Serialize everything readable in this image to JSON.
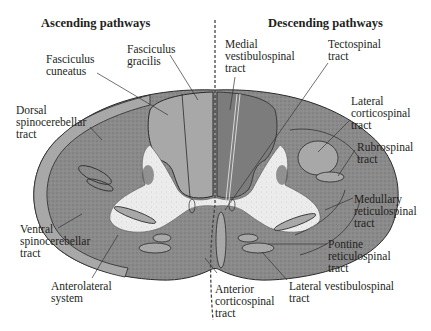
{
  "headings": {
    "ascending": "Ascending pathways",
    "descending": "Descending pathways"
  },
  "colors": {
    "tract_fill": "#a8a8a8",
    "white_matter": "#8c8c8c",
    "gray_matter": "#e8e8e8",
    "outline": "#2a2a2a",
    "leader": "#333333",
    "midline": "#444444"
  },
  "ascending_labels": [
    {
      "id": "fasciculus-gracilis",
      "text": "Fasciculus\ngracilis"
    },
    {
      "id": "fasciculus-cuneatus",
      "text": "Fasciculus\ncuneatus"
    },
    {
      "id": "dorsal-spinocerebellar",
      "text": "Dorsal\nspinocerebellar\ntract"
    },
    {
      "id": "ventral-spinocerebellar",
      "text": "Ventral\nspinocerebellar\ntract"
    },
    {
      "id": "anterolateral-system",
      "text": "Anterolateral\nsystem"
    }
  ],
  "descending_labels": [
    {
      "id": "medial-vestibulospinal",
      "text": "Medial\nvestibulospinal\ntract"
    },
    {
      "id": "tectospinal",
      "text": "Tectospinal\ntract"
    },
    {
      "id": "lateral-corticospinal",
      "text": "Lateral\ncorticospinal\ntract"
    },
    {
      "id": "rubrospinal",
      "text": "Rubrospinal\ntract"
    },
    {
      "id": "medullary-reticulospinal",
      "text": "Medullary\nreticulospinal\ntract"
    },
    {
      "id": "pontine-reticulospinal",
      "text": "Pontine\nreticulospinal\ntract"
    },
    {
      "id": "lateral-vestibulospinal",
      "text": "Lateral vestibulospinal\ntract"
    },
    {
      "id": "anterior-corticospinal",
      "text": "Anterior\ncorticospinal\ntract"
    }
  ]
}
